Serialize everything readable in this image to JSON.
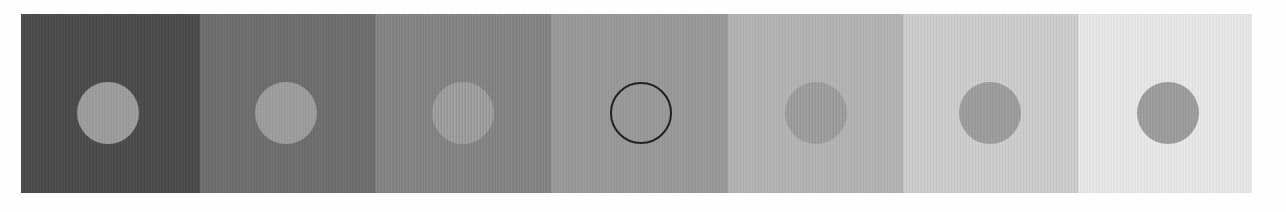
{
  "figure": {
    "caption": "",
    "background_color": "#ffffff",
    "strip": {
      "x": 21,
      "y": 14,
      "width": 1231,
      "height": 179,
      "panel_count": 7
    }
  },
  "chart_data": {
    "type": "heatmap",
    "subtitle": "",
    "xlabel": "",
    "ylabel": "",
    "categories": [
      "panel-1",
      "panel-2",
      "panel-3",
      "panel-4",
      "panel-5",
      "panel-6",
      "panel-7"
    ],
    "series": [
      {
        "name": "background luminance (0-255)",
        "values": [
          74,
          110,
          133,
          155,
          182,
          208,
          236
        ]
      },
      {
        "name": "disc luminance (0-255)",
        "values": [
          160,
          160,
          160,
          155,
          160,
          160,
          160
        ]
      }
    ],
    "ylim": [
      0,
      255
    ],
    "grid": false,
    "legend": "none",
    "annotations": [
      "Disc 4 is outlined in black; its fill equals the panel background."
    ]
  },
  "panels": [
    {
      "id": "panel-1",
      "index": 1,
      "background_color": "#4a4a4a",
      "background_value": 74,
      "x": 0,
      "width": 179,
      "disc": {
        "name": "gray-disc",
        "fill_color": "#a0a0a0",
        "fill_value": 160,
        "outline_only": false,
        "outline_color": "",
        "center_x": 87,
        "center_y": 99,
        "diameter": 62
      }
    },
    {
      "id": "panel-2",
      "index": 2,
      "background_color": "#6e6e6e",
      "background_value": 110,
      "x": 179,
      "width": 175,
      "disc": {
        "name": "gray-disc",
        "fill_color": "#a0a0a0",
        "fill_value": 160,
        "outline_only": false,
        "outline_color": "",
        "center_x": 86,
        "center_y": 99,
        "diameter": 62
      }
    },
    {
      "id": "panel-3",
      "index": 3,
      "background_color": "#858585",
      "background_value": 133,
      "x": 354,
      "width": 176,
      "disc": {
        "name": "gray-disc",
        "fill_color": "#a0a0a0",
        "fill_value": 160,
        "outline_only": false,
        "outline_color": "",
        "center_x": 88,
        "center_y": 99,
        "diameter": 62
      }
    },
    {
      "id": "panel-4",
      "index": 4,
      "background_color": "#9b9b9b",
      "background_value": 155,
      "x": 530,
      "width": 177,
      "disc": {
        "name": "outlined-disc",
        "fill_color": "#9b9b9b",
        "fill_value": 155,
        "outline_only": true,
        "outline_color": "#1d1d1d",
        "center_x": 90,
        "center_y": 99,
        "diameter": 62
      }
    },
    {
      "id": "panel-5",
      "index": 5,
      "background_color": "#b6b6b6",
      "background_value": 182,
      "x": 707,
      "width": 175,
      "disc": {
        "name": "gray-disc",
        "fill_color": "#a0a0a0",
        "fill_value": 160,
        "outline_only": false,
        "outline_color": "",
        "center_x": 88,
        "center_y": 99,
        "diameter": 62
      }
    },
    {
      "id": "panel-6",
      "index": 6,
      "background_color": "#d0d0d0",
      "background_value": 208,
      "x": 882,
      "width": 175,
      "disc": {
        "name": "gray-disc",
        "fill_color": "#a0a0a0",
        "fill_value": 160,
        "outline_only": false,
        "outline_color": "",
        "center_x": 87,
        "center_y": 99,
        "diameter": 62
      }
    },
    {
      "id": "panel-7",
      "index": 7,
      "background_color": "#ececec",
      "background_value": 236,
      "x": 1057,
      "width": 174,
      "disc": {
        "name": "gray-disc",
        "fill_color": "#a0a0a0",
        "fill_value": 160,
        "outline_only": false,
        "outline_color": "",
        "center_x": 90,
        "center_y": 99,
        "diameter": 62
      }
    }
  ]
}
